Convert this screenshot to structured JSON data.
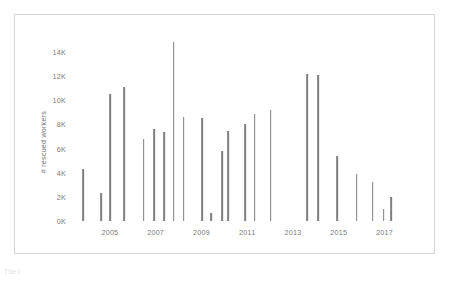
{
  "figure": {
    "background_color": "#ffffff",
    "frame_color": "#d6d6d6",
    "bar_color": "#7f7f7f",
    "tick_color": "#7a7a7a",
    "caption_partial": "The  f"
  },
  "chart_data": {
    "type": "bar",
    "title": "",
    "xlabel": "",
    "ylabel": "# rescued workers",
    "ylim": [
      0,
      15000
    ],
    "yticks": [
      0,
      2000,
      4000,
      6000,
      8000,
      10000,
      12000,
      14000
    ],
    "ytick_labels": [
      "0K",
      "2K",
      "4K",
      "6K",
      "8K",
      "10K",
      "12K",
      "14K"
    ],
    "xlim": [
      2003.3,
      2018.9
    ],
    "xticks": [
      2005,
      2007,
      2009,
      2011,
      2013,
      2015,
      2017
    ],
    "xtick_labels": [
      "2005",
      "2007",
      "2009",
      "2011",
      "2013",
      "2015",
      "2017"
    ],
    "grid": false,
    "legend": null,
    "categories": [
      "2003.8",
      "2004.6",
      "2005.0",
      "2005.6",
      "2006.3",
      "2006.8",
      "2007.2",
      "2007.6",
      "2008.0",
      "2008.5",
      "2009.1",
      "2009.6",
      "2010.0",
      "2010.3",
      "2010.8",
      "2011.3",
      "2011.7",
      "2012.2",
      "2013.7",
      "2014.3",
      "2014.8",
      "2015.5",
      "2016.3",
      "2016.9",
      "2017.4",
      "2017.8"
    ],
    "values": [
      4300,
      2300,
      10500,
      11100,
      6800,
      7600,
      7400,
      14800,
      8600,
      8500,
      700,
      5800,
      7500,
      8000,
      8900,
      9200,
      0,
      0,
      12200,
      12100,
      5400,
      3900,
      3200,
      2000,
      1000,
      0
    ],
    "points": [
      {
        "x": 2003.82,
        "y": 4300
      },
      {
        "x": 2004.62,
        "y": 2300
      },
      {
        "x": 2005.02,
        "y": 10500
      },
      {
        "x": 2005.62,
        "y": 11100
      },
      {
        "x": 2006.48,
        "y": 6800
      },
      {
        "x": 2006.92,
        "y": 7600
      },
      {
        "x": 2007.36,
        "y": 7400
      },
      {
        "x": 2007.78,
        "y": 14800
      },
      {
        "x": 2008.22,
        "y": 8600
      },
      {
        "x": 2009.02,
        "y": 8500
      },
      {
        "x": 2009.42,
        "y": 700
      },
      {
        "x": 2009.9,
        "y": 5800
      },
      {
        "x": 2010.16,
        "y": 7500
      },
      {
        "x": 2010.9,
        "y": 8000
      },
      {
        "x": 2011.32,
        "y": 8900
      },
      {
        "x": 2012.02,
        "y": 9200
      },
      {
        "x": 2013.62,
        "y": 12200
      },
      {
        "x": 2014.1,
        "y": 12100
      },
      {
        "x": 2014.92,
        "y": 5400
      },
      {
        "x": 2015.78,
        "y": 3900
      },
      {
        "x": 2016.48,
        "y": 3200
      },
      {
        "x": 2016.96,
        "y": 1000
      },
      {
        "x": 2017.3,
        "y": 2000
      }
    ]
  }
}
